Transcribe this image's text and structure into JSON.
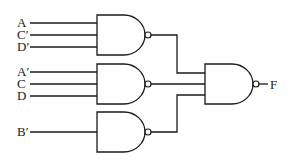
{
  "diagram": {
    "type": "logic-circuit",
    "gate_type": "NAND",
    "inputs": [
      {
        "label": "A",
        "gate": 1
      },
      {
        "label": "C′",
        "gate": 1
      },
      {
        "label": "D′",
        "gate": 1
      },
      {
        "label": "A′",
        "gate": 2
      },
      {
        "label": "C",
        "gate": 2
      },
      {
        "label": "D",
        "gate": 2
      },
      {
        "label": "B′",
        "gate": 3
      }
    ],
    "gates": [
      {
        "id": 1,
        "type": "NAND",
        "inputs": [
          "A",
          "C′",
          "D′"
        ]
      },
      {
        "id": 2,
        "type": "NAND",
        "inputs": [
          "A′",
          "C",
          "D"
        ]
      },
      {
        "id": 3,
        "type": "NAND",
        "inputs": [
          "B′"
        ]
      },
      {
        "id": 4,
        "type": "NAND",
        "inputs": [
          "gate1",
          "gate2",
          "gate3"
        ]
      }
    ],
    "output": {
      "label": "F"
    }
  }
}
